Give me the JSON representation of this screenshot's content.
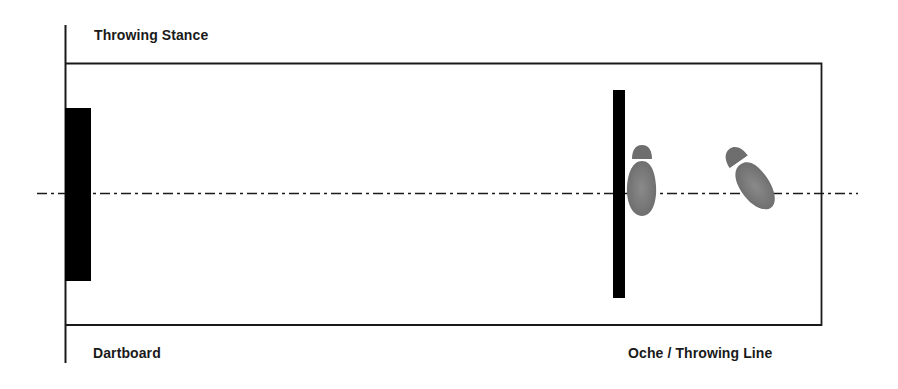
{
  "diagram": {
    "title": "Throwing Stance",
    "labels": {
      "dartboard": "Dartboard",
      "oche": "Oche / Throwing Line"
    },
    "elements": {
      "dartboard": {
        "x": 65,
        "y": 108,
        "width": 26,
        "height": 173,
        "color": "#000000"
      },
      "oche": {
        "x": 613,
        "y": 90,
        "width": 12,
        "height": 208,
        "color": "#000000"
      },
      "lane": {
        "x": 65,
        "y": 63,
        "width": 756,
        "height": 262
      },
      "centerline_y": 193,
      "feet": [
        {
          "name": "front-foot",
          "orientation": "pointing toward oche edge, heel up"
        },
        {
          "name": "back-foot",
          "orientation": "angled diagonally"
        }
      ]
    },
    "colors": {
      "line": "#1a1a1a",
      "foot": "#7a7a7a",
      "foot_band": "#ffffff"
    }
  }
}
